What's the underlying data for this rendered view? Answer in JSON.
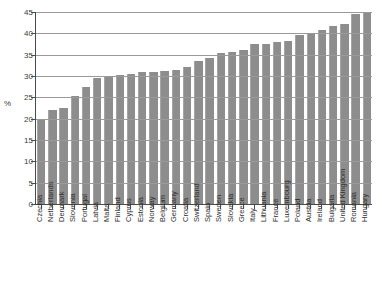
{
  "chart_data": {
    "type": "bar",
    "title": "",
    "subtitle": "",
    "xlabel": "",
    "ylabel": "%",
    "ylim": [
      0,
      45
    ],
    "ytick_step": 5,
    "yticks": [
      0,
      5,
      10,
      15,
      20,
      25,
      30,
      35,
      40,
      45
    ],
    "ytick_labels": [
      "0",
      "5",
      "10",
      "15",
      "20",
      "25",
      "30",
      "35",
      "40",
      "45"
    ],
    "grid": "horizontal",
    "legend": "none",
    "bar_color": "#8d8d8d",
    "axis_color": "#4a4a4a",
    "grid_color": "#9a9a9a",
    "categories": [
      "Czechia",
      "Netherlands",
      "Denmark",
      "Slovenia",
      "Portugal",
      "Latvia",
      "Malta",
      "Finland",
      "Cyprus",
      "Estonia",
      "Norway",
      "Belgium",
      "Germany",
      "Croatia",
      "Switzerland",
      "Spain",
      "Sweden",
      "Slovakia",
      "Greece",
      "Italy",
      "Lithuania",
      "France",
      "Luxembourg",
      "Poland",
      "Austria",
      "Ireland",
      "Bulgaria",
      "United Kingdom",
      "Romania",
      "Hungary"
    ],
    "values": [
      20.0,
      22.0,
      22.5,
      25.3,
      27.5,
      29.5,
      30.1,
      30.2,
      30.5,
      30.9,
      31.0,
      31.1,
      31.4,
      32.0,
      33.6,
      34.2,
      35.5,
      35.6,
      36.2,
      37.4,
      37.5,
      38.0,
      38.1,
      39.6,
      40.0,
      40.8,
      41.8,
      42.2,
      44.6,
      45.0
    ]
  }
}
